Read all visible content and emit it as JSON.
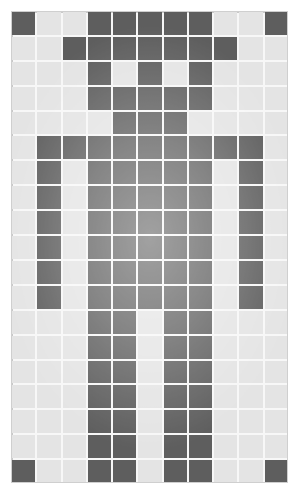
{
  "grid": {
    "columns": 11,
    "rows": 19,
    "colors": {
      "on": "#5e5e5e",
      "off": "#e4e4e4",
      "gridline": "#f7f7f7",
      "background": "#ffffff"
    },
    "pattern": [
      "X..XXXXX..X",
      "..XXXXXXX..",
      "...X.X.X...",
      "...XXXXX...",
      "....XXX....",
      ".XXXXXXXXX.",
      ".X.XXXXX.X.",
      ".X.XXXXX.X.",
      ".X.XXXXX.X.",
      ".X.XXXXX.X.",
      ".X.XXXXX.X.",
      ".X.XXXXX.X.",
      "...XX.XX...",
      "...XX.XX...",
      "...XX.XX...",
      "...XX.XX...",
      "...XX.XX...",
      "...XX.XX...",
      "X..XX.XX..X"
    ]
  }
}
